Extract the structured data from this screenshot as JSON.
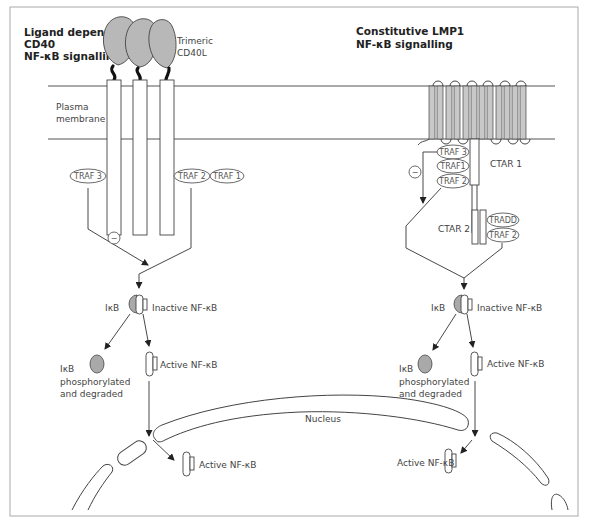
{
  "left_panel": {
    "title_line1": "Ligand dependent",
    "title_line2": "CD40",
    "title_line3": "NF-κB signalling",
    "ligand_label_line1": "Trimeric",
    "ligand_label_line2": "CD40L",
    "membrane_label_line1": "Plasma",
    "membrane_label_line2": "membrane",
    "traf_left": "TRAF 3",
    "traf_right_1": "TRAF 2",
    "traf_right_2": "TRAF 1",
    "inhibit_symbol": "−",
    "ikb_label": "IκB",
    "inactive_label": "Inactive NF-κB",
    "degraded_line1": "IκB",
    "degraded_line2": "phosphorylated",
    "degraded_line3": "and degraded",
    "active_label": "Active NF-κB",
    "nuclear_active_label": "Active NF-κB"
  },
  "right_panel": {
    "title_line1": "Constitutive LMP1",
    "title_line2": "NF-κB signalling",
    "traf_top": "TRAF 3",
    "traf_mid": "TRAF1",
    "traf_bot": "TRAF 2",
    "ctar1_label": "CTAR 1",
    "ctar2_label": "CTAR 2",
    "tradd": "TRADD",
    "traf2_ctar2": "TRAF 2",
    "inhibit_symbol": "−",
    "ikb_label": "IκB",
    "inactive_label": "Inactive NF-κB",
    "degraded_line1": "IκB",
    "degraded_line2": "phosphorylated",
    "degraded_line3": "and degraded",
    "active_label": "Active NF-κB",
    "nuclear_active_label": "Active NF-κB"
  },
  "nucleus_label": "Nucleus",
  "colors": {
    "ligand_fill": "#b8b8b8",
    "ikb_fill": "#a9a9a9",
    "transmembrane_fill": "#c8c8c8",
    "line": "#333333",
    "border": "#aaaaaa"
  }
}
